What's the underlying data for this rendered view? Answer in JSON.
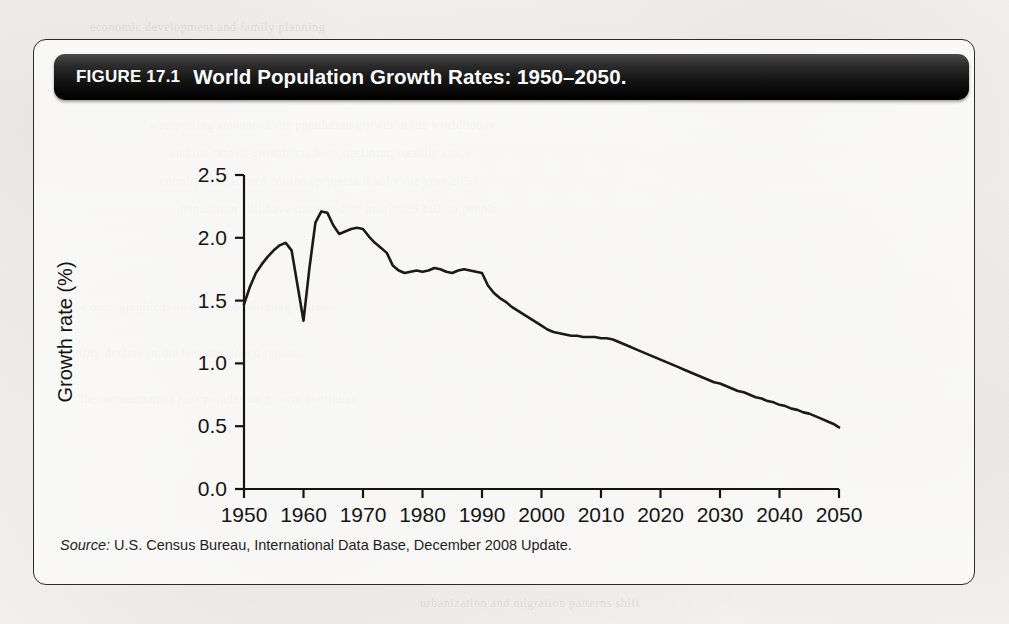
{
  "figure": {
    "label": "FIGURE 17.1",
    "title": "World Population Growth Rates: 1950–2050.",
    "source_word": "Source:",
    "source_text": " U.S. Census Bureau, International Data Base, December 2008 Update."
  },
  "bleed_text": [
    "a surprising amount of the population growth in the world today",
    "and the rate of growth has been declining steadily since",
    "country. The United Nations projects that by the year 2050",
    "population will have increased by nearly 2.5 billion people",
    "the demographic transition in developing nations",
    "fertility decline in the less developed regions",
    "the momentum of past population growth continues",
    "urbanization and migration patterns shift",
    "economic development and family planning"
  ],
  "chart_data": {
    "type": "line",
    "title": "World Population Growth Rates: 1950–2050.",
    "xlabel": "Year",
    "ylabel": "Growth rate (%)",
    "xlim": [
      1950,
      2050
    ],
    "ylim": [
      0.0,
      2.5
    ],
    "xticks": [
      1950,
      1960,
      1970,
      1980,
      1990,
      2000,
      2010,
      2020,
      2030,
      2040,
      2050
    ],
    "xtick_labels": [
      "1950",
      "1960",
      "1970",
      "1980",
      "1990",
      "2000",
      "2010",
      "2020",
      "2030",
      "2040",
      "2050"
    ],
    "yticks": [
      0.0,
      0.5,
      1.0,
      1.5,
      2.0,
      2.5
    ],
    "ytick_labels": [
      "0.0",
      "0.5",
      "1.0",
      "1.5",
      "2.0",
      "2.5"
    ],
    "grid": false,
    "legend": null,
    "line_color": "#1a1a1a",
    "series": [
      {
        "name": "World population growth rate",
        "x": [
          1950,
          1951,
          1952,
          1953,
          1954,
          1955,
          1956,
          1957,
          1958,
          1959,
          1960,
          1961,
          1962,
          1963,
          1964,
          1965,
          1966,
          1967,
          1968,
          1969,
          1970,
          1971,
          1972,
          1973,
          1974,
          1975,
          1976,
          1977,
          1978,
          1979,
          1980,
          1981,
          1982,
          1983,
          1984,
          1985,
          1986,
          1987,
          1988,
          1989,
          1990,
          1991,
          1992,
          1993,
          1994,
          1995,
          1996,
          1997,
          1998,
          1999,
          2000,
          2001,
          2002,
          2003,
          2004,
          2005,
          2006,
          2007,
          2008,
          2009,
          2010,
          2011,
          2012,
          2013,
          2014,
          2015,
          2016,
          2017,
          2018,
          2019,
          2020,
          2021,
          2022,
          2023,
          2024,
          2025,
          2026,
          2027,
          2028,
          2029,
          2030,
          2031,
          2032,
          2033,
          2034,
          2035,
          2036,
          2037,
          2038,
          2039,
          2040,
          2041,
          2042,
          2043,
          2044,
          2045,
          2046,
          2047,
          2048,
          2049,
          2050
        ],
        "y": [
          1.47,
          1.61,
          1.72,
          1.79,
          1.85,
          1.9,
          1.94,
          1.96,
          1.9,
          1.62,
          1.34,
          1.76,
          2.12,
          2.21,
          2.2,
          2.1,
          2.03,
          2.05,
          2.07,
          2.08,
          2.07,
          2.01,
          1.96,
          1.92,
          1.88,
          1.78,
          1.74,
          1.72,
          1.73,
          1.74,
          1.73,
          1.74,
          1.76,
          1.75,
          1.73,
          1.72,
          1.74,
          1.75,
          1.74,
          1.73,
          1.72,
          1.62,
          1.56,
          1.52,
          1.49,
          1.45,
          1.42,
          1.39,
          1.36,
          1.33,
          1.3,
          1.27,
          1.25,
          1.24,
          1.23,
          1.22,
          1.22,
          1.21,
          1.21,
          1.21,
          1.2,
          1.2,
          1.19,
          1.17,
          1.15,
          1.13,
          1.11,
          1.09,
          1.07,
          1.05,
          1.03,
          1.01,
          0.99,
          0.97,
          0.95,
          0.93,
          0.91,
          0.89,
          0.87,
          0.85,
          0.84,
          0.82,
          0.8,
          0.78,
          0.77,
          0.75,
          0.73,
          0.72,
          0.7,
          0.69,
          0.67,
          0.66,
          0.64,
          0.63,
          0.61,
          0.6,
          0.58,
          0.56,
          0.54,
          0.52,
          0.49
        ]
      }
    ]
  }
}
